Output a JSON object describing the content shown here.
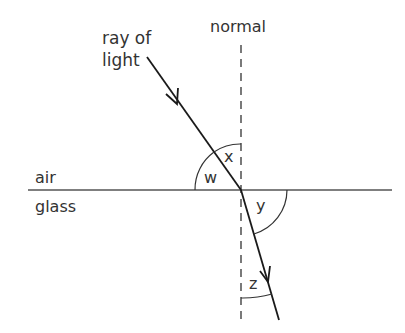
{
  "diagram": {
    "labels": {
      "ray_line1": "ray of",
      "ray_line2": "light",
      "normal": "normal",
      "air": "air",
      "glass": "glass",
      "angle_w": "w",
      "angle_x": "x",
      "angle_y": "y",
      "angle_z": "z"
    },
    "colors": {
      "line": "#1a1a1a",
      "boundary": "#555555",
      "text": "#333333",
      "background": "#ffffff"
    }
  }
}
